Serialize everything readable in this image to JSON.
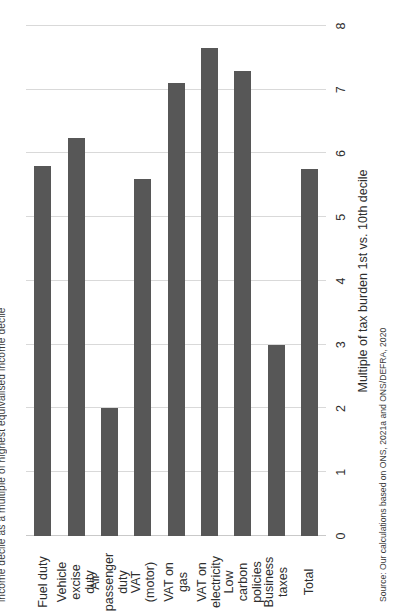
{
  "figure": {
    "title": "income decile as a multiple of highest equivalised income decile",
    "source": "Source: Our calculations based on ONS, 2021a and ONS/DEFRA, 2020",
    "value_axis_label": "Multiple of tax burden 1st vs. 10th decile",
    "bar_color": "#575757",
    "grid_color": "#d9d9d9",
    "text_color": "#2e2e2e"
  },
  "chart_data": {
    "type": "bar",
    "orientation": "horizontal",
    "title": "income decile as a multiple of highest equivalised income decile",
    "xlabel": "Multiple of tax burden 1st vs. 10th decile",
    "ylabel": "",
    "ylim": [
      0,
      8
    ],
    "grid": true,
    "legend": "none",
    "categories": [
      "Fuel duty",
      "Vehicle excise duty",
      "Air passenger duty",
      "VAT (motor)",
      "VAT on gas",
      "VAT on electricity",
      "Low carbon policies",
      "Business taxes",
      "Total"
    ],
    "category_lines": [
      [
        "Fuel duty"
      ],
      [
        "Vehicle",
        "excise",
        "duty"
      ],
      [
        "Air",
        "passenger",
        "duty"
      ],
      [
        "VAT",
        "(motor)"
      ],
      [
        "VAT on",
        "gas"
      ],
      [
        "VAT on",
        "electricity"
      ],
      [
        "Low",
        "carbon",
        "policies"
      ],
      [
        "Business",
        "taxes"
      ],
      [
        "Total"
      ]
    ],
    "values": [
      5.8,
      6.25,
      2.0,
      5.6,
      7.1,
      7.65,
      7.3,
      3.0,
      5.75
    ],
    "tick_labels": [
      "0",
      "1",
      "2",
      "3",
      "4",
      "5",
      "6",
      "7",
      "8"
    ],
    "ticks": [
      0,
      1,
      2,
      3,
      4,
      5,
      6,
      7,
      8
    ]
  }
}
